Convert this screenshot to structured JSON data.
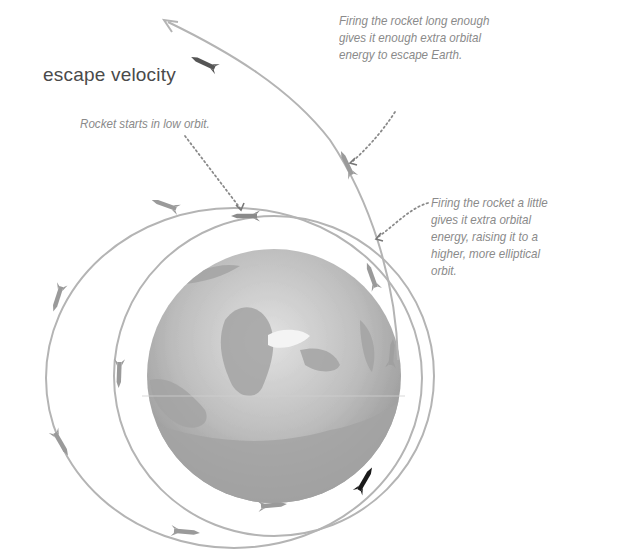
{
  "title": "escape velocity",
  "annotations": {
    "low_orbit": "Rocket starts in low orbit.",
    "escape": "Firing the rocket long enough\ngives it enough extra orbital\nenergy to escape Earth.",
    "little": "Firing the rocket a little\ngives it extra orbital\nenergy, raising it to a\nhigher, more elliptical\norbit."
  },
  "diagram": {
    "elements": [
      "earth-globe",
      "low-orbit-circle",
      "elliptical-orbit",
      "escape-trajectory",
      "rockets",
      "dotted-leader-lines"
    ],
    "colors": {
      "orbit_line": "#b4b4b4",
      "rocket": "#9a9a9a",
      "rocket_firing": "#1a1a1a",
      "globe_ocean": "#a9a9a9",
      "globe_land": "#c8c8c8",
      "text_title": "#4a4a4a",
      "text_note": "#8a8a8a"
    }
  }
}
